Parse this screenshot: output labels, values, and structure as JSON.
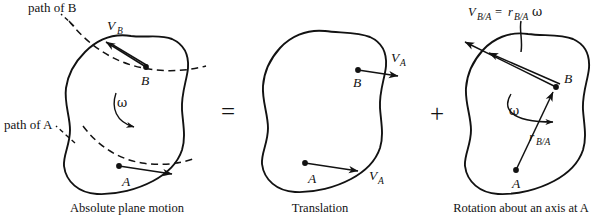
{
  "figure": {
    "type": "engineering-mechanics-diagram",
    "background_color": "#ffffff",
    "ink_color": "#121212"
  },
  "panels": [
    {
      "id": "absolute",
      "caption": "Absolute plane motion",
      "points": [
        {
          "label": "B"
        },
        {
          "label": "A"
        }
      ],
      "vectors": [
        {
          "label": "V",
          "sub": "B"
        }
      ],
      "annotations": [
        {
          "text": "path of B"
        },
        {
          "text": "path of A"
        },
        {
          "text": "ω"
        }
      ]
    },
    {
      "id": "translation",
      "caption": "Translation",
      "points": [
        {
          "label": "B"
        },
        {
          "label": "A"
        }
      ],
      "vectors": [
        {
          "label": "V",
          "sub": "A"
        },
        {
          "label": "V",
          "sub": "A"
        }
      ],
      "annotations": []
    },
    {
      "id": "rotation",
      "caption": "Rotation about an axis at A",
      "points": [
        {
          "label": "B"
        },
        {
          "label": "A"
        }
      ],
      "vectors": [
        {
          "label": "r",
          "sub": "B/A"
        }
      ],
      "annotations": [
        {
          "text": "ω"
        }
      ],
      "formula": {
        "lhs_symbol": "V",
        "lhs_sub": "B/A",
        "equals": "=",
        "rhs_symbol": "r",
        "rhs_sub": "B/A",
        "rhs_omega": "ω"
      }
    }
  ],
  "operators": {
    "equals": "=",
    "plus": "+"
  },
  "labels": {
    "point_a": "A",
    "point_b": "B",
    "v_symbol": "V",
    "r_symbol": "r",
    "sub_a": "A",
    "sub_b": "B",
    "sub_ba": "B/A",
    "omega": "ω",
    "path_of_b": "path of B",
    "path_of_a": "path of A",
    "caption_absolute": "Absolute plane motion",
    "caption_translation": "Translation",
    "caption_rotation": "Rotation about an axis at A"
  }
}
